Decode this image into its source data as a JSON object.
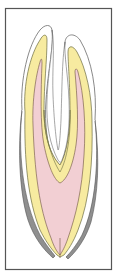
{
  "figure": {
    "title": "",
    "colors": {
      "background": "#ffffff",
      "frame_border": "#555555",
      "outline": "#6b6b6b",
      "dentin": "#f7eba0",
      "pulp": "#f2cfd3",
      "cementum_shadow": "#8f8f8f",
      "root_outline_thin": "#7a7a7a"
    },
    "layers": [
      {
        "name": "outer-contour",
        "label": ""
      },
      {
        "name": "dentin",
        "label": ""
      },
      {
        "name": "pulp",
        "label": ""
      },
      {
        "name": "cementum",
        "label": ""
      }
    ]
  }
}
